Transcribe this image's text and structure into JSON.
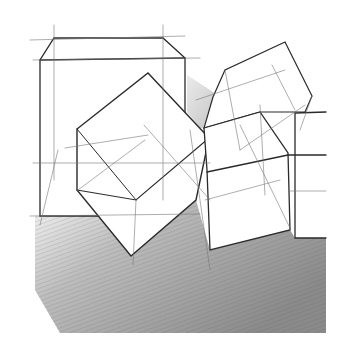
{
  "image": {
    "subject": "pencil sketch of cubes in perspective with construction lines",
    "colors": {
      "paper": "#ffffff",
      "line": "#2a2a2a",
      "shade_dark": "#6b6b6b",
      "shade_light": "#e6e6e6"
    }
  }
}
